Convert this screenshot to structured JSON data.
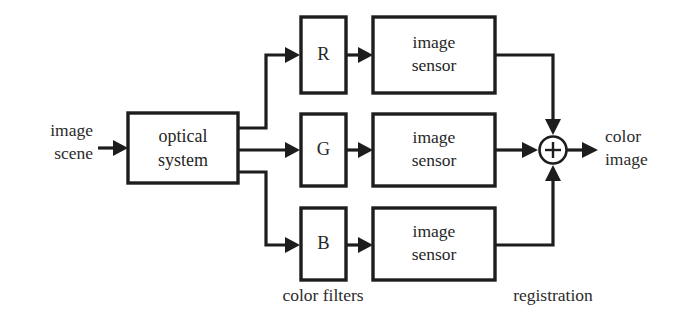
{
  "diagram": {
    "line_color": "#1d1d1d",
    "text_color": "#2b2b2b",
    "background": "#ffffff",
    "input": {
      "line1": "image",
      "line2": "scene"
    },
    "optical_system": {
      "line1": "optical",
      "line2": "system"
    },
    "filters": [
      {
        "label": "R",
        "name": "red-filter"
      },
      {
        "label": "G",
        "name": "green-filter"
      },
      {
        "label": "B",
        "name": "blue-filter"
      }
    ],
    "sensors": [
      {
        "line1": "image",
        "line2": "sensor"
      },
      {
        "line1": "image",
        "line2": "sensor"
      },
      {
        "line1": "image",
        "line2": "sensor"
      }
    ],
    "summing_junction": {
      "symbol": "+",
      "name": "summing-junction"
    },
    "output": {
      "line1": "color",
      "line2": "image"
    },
    "group_labels": {
      "filters": "color filters",
      "registration": "registration"
    }
  }
}
